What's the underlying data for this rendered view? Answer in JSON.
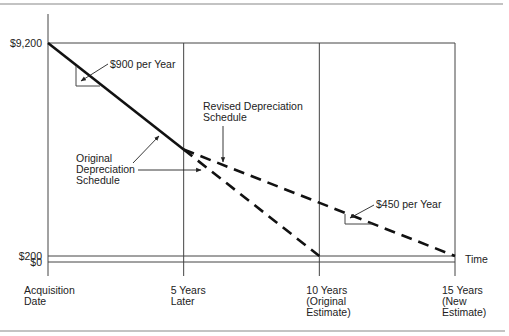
{
  "chart_data": {
    "type": "line",
    "title": "",
    "xlabel": "Time",
    "ylabel": "",
    "x_unit": "years",
    "xlim": [
      0,
      15
    ],
    "ylim": [
      0,
      9200
    ],
    "x_ticks": [
      {
        "value": 0,
        "lines": [
          "Acquisition",
          "Date"
        ]
      },
      {
        "value": 5,
        "lines": [
          "5 Years",
          "Later"
        ]
      },
      {
        "value": 10,
        "lines": [
          "10 Years",
          "(Original",
          "Estimate)"
        ]
      },
      {
        "value": 15,
        "lines": [
          "15 Years",
          "(New",
          "Estimate)"
        ]
      }
    ],
    "y_ticks": [
      {
        "value": 9200,
        "label": "$9,200"
      },
      {
        "value": 200,
        "label": "$200"
      },
      {
        "value": 0,
        "label": "$0"
      }
    ],
    "series": [
      {
        "name": "Original Depreciation Schedule",
        "style": "solid+dashed",
        "points": [
          {
            "x": 0,
            "y": 9200
          },
          {
            "x": 5,
            "y": 4700
          },
          {
            "x": 10,
            "y": 200
          }
        ]
      },
      {
        "name": "Revised Depreciation Schedule",
        "style": "dashed",
        "points": [
          {
            "x": 5,
            "y": 4700
          },
          {
            "x": 15,
            "y": 200
          }
        ]
      }
    ],
    "annotations": [
      {
        "id": "rate-original",
        "text": "$900 per Year"
      },
      {
        "id": "rate-revised",
        "text": "$450 per Year"
      },
      {
        "id": "label-revised",
        "lines": [
          "Revised Depreciation",
          "Schedule"
        ]
      },
      {
        "id": "label-original",
        "lines": [
          "Original",
          "Depreciation",
          "Schedule"
        ]
      }
    ],
    "grid": true,
    "legend": "none"
  }
}
